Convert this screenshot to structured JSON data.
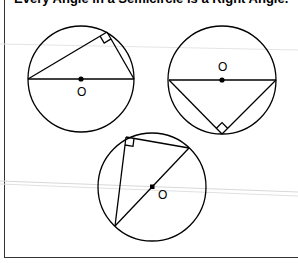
{
  "title": "Every Angle in a Semicircle is a Right Angle.",
  "colors": {
    "stroke": "#000000",
    "frame": "#333333",
    "artifact": "#d8d8d8",
    "background": "#ffffff"
  },
  "diagrams": [
    {
      "id": "circle-1",
      "center_label": "O",
      "center": [
        81,
        79
      ],
      "radius": 53,
      "diameter": [
        [
          28,
          79
        ],
        [
          134,
          79
        ]
      ],
      "vertex": [
        107,
        32
      ],
      "right_angle_mark": true
    },
    {
      "id": "circle-2",
      "center_label": "O",
      "center": [
        222,
        80
      ],
      "radius": 54,
      "diameter": [
        [
          169,
          80
        ],
        [
          276,
          80
        ]
      ],
      "vertex": [
        222,
        134
      ],
      "right_angle_mark": true
    },
    {
      "id": "circle-3",
      "center_label": "O",
      "center": [
        152,
        187
      ],
      "radius": 54,
      "diameter": [
        [
          189,
          148
        ],
        [
          115,
          226
        ]
      ],
      "vertex": [
        126,
        137
      ],
      "right_angle_mark": true
    }
  ]
}
